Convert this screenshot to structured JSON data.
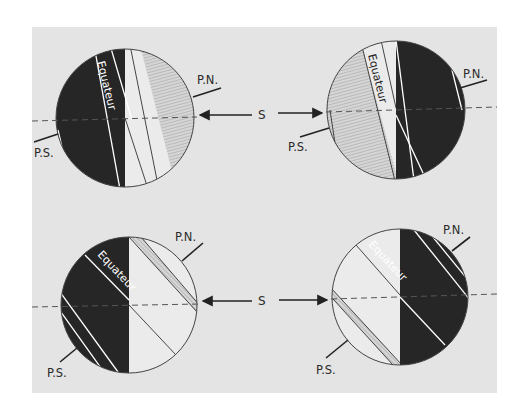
{
  "figure": {
    "background": "#ffffff",
    "panel_color": "#e4e4e4",
    "night_color": "#262626",
    "day_color": "#ebebeb",
    "hatch_color": "#9a9a9a",
    "sun_label": "S",
    "labels": {
      "north_pole": "P.N.",
      "south_pole": "P.S.",
      "equator": "Equateur"
    }
  },
  "diagrams": [
    {
      "id": "top-left",
      "position": "top-left",
      "sun_side": "right",
      "north_pole_label": "P.N.",
      "south_pole_label": "P.S.",
      "equator_label": "Equateur",
      "axis_tilt": "slight, north pole toward sun"
    },
    {
      "id": "top-right",
      "position": "top-right",
      "sun_side": "left",
      "north_pole_label": "P.N.",
      "south_pole_label": "P.S.",
      "equator_label": "Equateur",
      "axis_tilt": "slight, north pole away from sun"
    },
    {
      "id": "bottom-left",
      "position": "bottom-left",
      "sun_side": "right",
      "north_pole_label": "P.N.",
      "south_pole_label": "P.S.",
      "equator_label": "Equateur",
      "axis_tilt": "strong, north pole toward sun"
    },
    {
      "id": "bottom-right",
      "position": "bottom-right",
      "sun_side": "left",
      "north_pole_label": "P.N.",
      "south_pole_label": "P.S.",
      "equator_label": "Equateur",
      "axis_tilt": "strong, north pole away from sun"
    }
  ],
  "sun_arrows": [
    {
      "row": "top",
      "label": "S",
      "directions": [
        "left",
        "right"
      ]
    },
    {
      "row": "bottom",
      "label": "S",
      "directions": [
        "left",
        "right"
      ]
    }
  ]
}
